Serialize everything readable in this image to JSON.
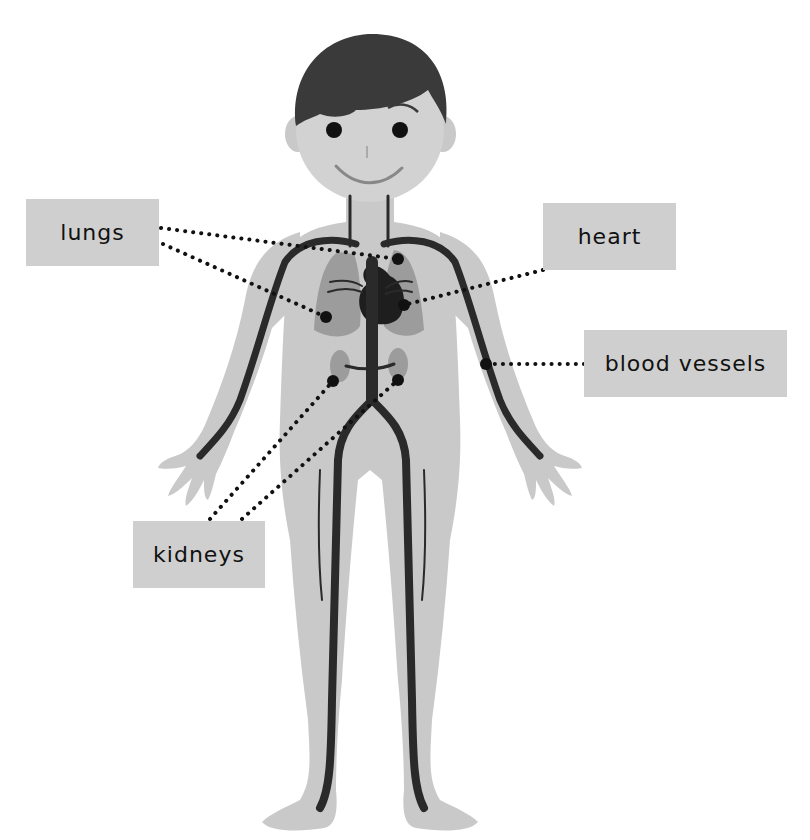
{
  "diagram": {
    "colors": {
      "background": "#ffffff",
      "skin": "#c9c9c9",
      "face": "#d2d2d2",
      "hair": "#3a3a3a",
      "organ": "#9c9c9c",
      "vessel": "#2a2a2a",
      "label_bg": "#cfcfcf",
      "leader": "#111111"
    },
    "labels": [
      {
        "id": "lungs",
        "text": "lungs",
        "x": 26,
        "y": 199,
        "w": 133,
        "h": 67
      },
      {
        "id": "heart",
        "text": "heart",
        "x": 543,
        "y": 203,
        "w": 133,
        "h": 67
      },
      {
        "id": "blood-vessels",
        "text": "blood vessels",
        "x": 584,
        "y": 330,
        "w": 203,
        "h": 67
      },
      {
        "id": "kidneys",
        "text": "kidneys",
        "x": 133,
        "y": 521,
        "w": 132,
        "h": 67
      }
    ],
    "leaders": [
      {
        "target": "lungs",
        "from": [
          161,
          228
        ],
        "to": [
          398,
          259
        ]
      },
      {
        "target": "lungs",
        "from": [
          163,
          244
        ],
        "to": [
          326,
          317
        ]
      },
      {
        "target": "heart",
        "from": [
          543,
          270
        ],
        "to": [
          404,
          305
        ]
      },
      {
        "target": "blood-vessels",
        "from": [
          584,
          364
        ],
        "to": [
          486,
          364
        ]
      },
      {
        "target": "kidneys",
        "from": [
          210,
          519
        ],
        "to": [
          333,
          381
        ]
      },
      {
        "target": "kidneys",
        "from": [
          242,
          519
        ],
        "to": [
          398,
          380
        ]
      }
    ]
  }
}
